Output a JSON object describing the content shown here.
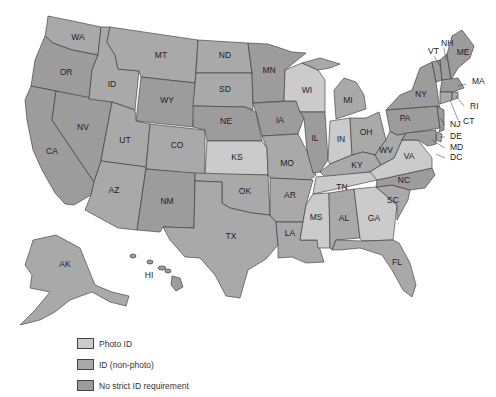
{
  "legend": {
    "items": [
      {
        "key": "photo",
        "label": "Photo ID",
        "color": "#cbcbcb"
      },
      {
        "key": "nonphoto",
        "label": "ID (non-photo)",
        "color": "#a9a9a9"
      },
      {
        "key": "none",
        "label": "No strict ID requirement",
        "color": "#9c9c9c"
      }
    ]
  },
  "colors": {
    "photo": "#cbcbcb",
    "nonphoto": "#a9a9a9",
    "none": "#9c9c9c",
    "stroke": "#333333"
  },
  "states": [
    {
      "abbr": "WA",
      "cat": "nonphoto",
      "lx": 78,
      "ly": 38
    },
    {
      "abbr": "OR",
      "cat": "none",
      "lx": 66,
      "ly": 73
    },
    {
      "abbr": "CA",
      "cat": "none",
      "lx": 52,
      "ly": 152
    },
    {
      "abbr": "NV",
      "cat": "none",
      "lx": 83,
      "ly": 128
    },
    {
      "abbr": "ID",
      "cat": "nonphoto",
      "lx": 112,
      "ly": 85
    },
    {
      "abbr": "MT",
      "cat": "nonphoto",
      "lx": 161,
      "ly": 56
    },
    {
      "abbr": "WY",
      "cat": "none",
      "lx": 167,
      "ly": 101
    },
    {
      "abbr": "UT",
      "cat": "nonphoto",
      "lx": 125,
      "ly": 141
    },
    {
      "abbr": "CO",
      "cat": "nonphoto",
      "lx": 177,
      "ly": 146
    },
    {
      "abbr": "AZ",
      "cat": "nonphoto",
      "lx": 114,
      "ly": 191
    },
    {
      "abbr": "NM",
      "cat": "none",
      "lx": 167,
      "ly": 202
    },
    {
      "abbr": "ND",
      "cat": "nonphoto",
      "lx": 225,
      "ly": 56
    },
    {
      "abbr": "SD",
      "cat": "nonphoto",
      "lx": 225,
      "ly": 90
    },
    {
      "abbr": "NE",
      "cat": "none",
      "lx": 226,
      "ly": 122
    },
    {
      "abbr": "KS",
      "cat": "photo",
      "lx": 237,
      "ly": 158
    },
    {
      "abbr": "OK",
      "cat": "nonphoto",
      "lx": 245,
      "ly": 192
    },
    {
      "abbr": "TX",
      "cat": "nonphoto",
      "lx": 231,
      "ly": 237
    },
    {
      "abbr": "MN",
      "cat": "none",
      "lx": 269,
      "ly": 71
    },
    {
      "abbr": "IA",
      "cat": "none",
      "lx": 280,
      "ly": 121
    },
    {
      "abbr": "MO",
      "cat": "nonphoto",
      "lx": 287,
      "ly": 164
    },
    {
      "abbr": "AR",
      "cat": "nonphoto",
      "lx": 290,
      "ly": 196
    },
    {
      "abbr": "LA",
      "cat": "nonphoto",
      "lx": 290,
      "ly": 234
    },
    {
      "abbr": "WI",
      "cat": "photo",
      "lx": 307,
      "ly": 91
    },
    {
      "abbr": "IL",
      "cat": "none",
      "lx": 315,
      "ly": 139
    },
    {
      "abbr": "MI",
      "cat": "nonphoto",
      "lx": 348,
      "ly": 101
    },
    {
      "abbr": "IN",
      "cat": "photo",
      "lx": 341,
      "ly": 140
    },
    {
      "abbr": "OH",
      "cat": "nonphoto",
      "lx": 366,
      "ly": 133
    },
    {
      "abbr": "KY",
      "cat": "nonphoto",
      "lx": 357,
      "ly": 166
    },
    {
      "abbr": "TN",
      "cat": "photo",
      "lx": 342,
      "ly": 188
    },
    {
      "abbr": "MS",
      "cat": "photo",
      "lx": 316,
      "ly": 218
    },
    {
      "abbr": "AL",
      "cat": "nonphoto",
      "lx": 344,
      "ly": 219
    },
    {
      "abbr": "GA",
      "cat": "photo",
      "lx": 374,
      "ly": 219
    },
    {
      "abbr": "FL",
      "cat": "nonphoto",
      "lx": 397,
      "ly": 263
    },
    {
      "abbr": "SC",
      "cat": "nonphoto",
      "lx": 393,
      "ly": 201
    },
    {
      "abbr": "NC",
      "cat": "none",
      "lx": 404,
      "ly": 181
    },
    {
      "abbr": "VA",
      "cat": "photo",
      "lx": 409,
      "ly": 157
    },
    {
      "abbr": "WV",
      "cat": "nonphoto",
      "lx": 386,
      "ly": 151
    },
    {
      "abbr": "PA",
      "cat": "none",
      "lx": 405,
      "ly": 119
    },
    {
      "abbr": "NY",
      "cat": "none",
      "lx": 421,
      "ly": 95
    },
    {
      "abbr": "ME",
      "cat": "none",
      "lx": 463,
      "ly": 53
    },
    {
      "abbr": "VT",
      "cat": "none",
      "lx": 428,
      "ly": 52
    },
    {
      "abbr": "NH",
      "cat": "none",
      "lx": 441,
      "ly": 44
    },
    {
      "abbr": "MA",
      "cat": "none",
      "lx": 472,
      "ly": 82
    },
    {
      "abbr": "RI",
      "cat": "nonphoto",
      "lx": 470,
      "ly": 107
    },
    {
      "abbr": "CT",
      "cat": "nonphoto",
      "lx": 463,
      "ly": 122
    },
    {
      "abbr": "NJ",
      "cat": "none",
      "lx": 450,
      "ly": 125
    },
    {
      "abbr": "DE",
      "cat": "nonphoto",
      "lx": 450,
      "ly": 137
    },
    {
      "abbr": "MD",
      "cat": "none",
      "lx": 450,
      "ly": 148
    },
    {
      "abbr": "DC",
      "cat": "none",
      "lx": 450,
      "ly": 158
    },
    {
      "abbr": "AK",
      "cat": "nonphoto",
      "lx": 65,
      "ly": 265
    },
    {
      "abbr": "HI",
      "cat": "none",
      "lx": 149,
      "ly": 276
    }
  ]
}
